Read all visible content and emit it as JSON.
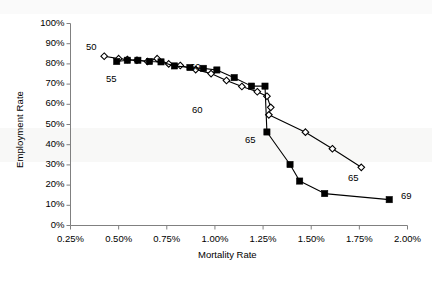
{
  "chart_data": {
    "type": "scatter",
    "title": "",
    "xlabel": "Mortality Rate",
    "ylabel": "Employment Rate",
    "xlim": [
      0.0025,
      0.02
    ],
    "ylim": [
      0,
      1.0
    ],
    "grid": false,
    "legend_position": "bottom-center",
    "x_tick_labels": [
      "0.25%",
      "0.50%",
      "0.75%",
      "1.00%",
      "1.25%",
      "1.50%",
      "1.75%",
      "2.00%"
    ],
    "x_tick_values": [
      0.0025,
      0.005,
      0.0075,
      0.01,
      0.0125,
      0.015,
      0.0175,
      0.02
    ],
    "y_tick_labels": [
      "0%",
      "10%",
      "20%",
      "30%",
      "40%",
      "50%",
      "60%",
      "70%",
      "80%",
      "90%",
      "100%"
    ],
    "y_tick_values": [
      0,
      0.1,
      0.2,
      0.3,
      0.4,
      0.5,
      0.6,
      0.7,
      0.8,
      0.9,
      1.0
    ],
    "series": [
      {
        "name": "1995",
        "marker": "open-diamond",
        "color": "#000000",
        "points": [
          {
            "x": 0.00425,
            "y": 0.838,
            "age": 50,
            "label": "50",
            "label_pos": "above"
          },
          {
            "x": 0.005,
            "y": 0.826,
            "age": 51
          },
          {
            "x": 0.00545,
            "y": 0.822,
            "age": 52
          },
          {
            "x": 0.00595,
            "y": 0.818,
            "age": 53
          },
          {
            "x": 0.0065,
            "y": 0.812,
            "age": 54
          },
          {
            "x": 0.007,
            "y": 0.826,
            "age": 55,
            "label": "55",
            "label_pos": "below"
          },
          {
            "x": 0.0076,
            "y": 0.8,
            "age": 56
          },
          {
            "x": 0.0082,
            "y": 0.792,
            "age": 57
          },
          {
            "x": 0.009,
            "y": 0.772,
            "age": 58
          },
          {
            "x": 0.0098,
            "y": 0.752,
            "age": 59
          },
          {
            "x": 0.0106,
            "y": 0.718,
            "age": 60,
            "label": "60",
            "label_pos": "below"
          },
          {
            "x": 0.0114,
            "y": 0.688,
            "age": 61
          },
          {
            "x": 0.0122,
            "y": 0.662,
            "age": 62
          },
          {
            "x": 0.0127,
            "y": 0.64,
            "age": 63
          },
          {
            "x": 0.0129,
            "y": 0.585,
            "age": 64
          },
          {
            "x": 0.0128,
            "y": 0.548,
            "age": 65
          },
          {
            "x": 0.0147,
            "y": 0.462,
            "age": 66
          },
          {
            "x": 0.0161,
            "y": 0.38,
            "age": 67
          },
          {
            "x": 0.0176,
            "y": 0.288,
            "age": 69,
            "label": "65",
            "label_pos": "below"
          }
        ]
      },
      {
        "name": "2009",
        "marker": "filled-square",
        "color": "#000000",
        "points": [
          {
            "x": 0.0049,
            "y": 0.812,
            "age": 50
          },
          {
            "x": 0.00545,
            "y": 0.818,
            "age": 51
          },
          {
            "x": 0.006,
            "y": 0.818,
            "age": 52
          },
          {
            "x": 0.0066,
            "y": 0.812,
            "age": 53
          },
          {
            "x": 0.0072,
            "y": 0.81,
            "age": 54
          },
          {
            "x": 0.0079,
            "y": 0.79,
            "age": 55
          },
          {
            "x": 0.0087,
            "y": 0.782,
            "age": 56
          },
          {
            "x": 0.0094,
            "y": 0.778,
            "age": 57
          },
          {
            "x": 0.0101,
            "y": 0.77,
            "age": 58
          },
          {
            "x": 0.011,
            "y": 0.732,
            "age": 59
          },
          {
            "x": 0.0119,
            "y": 0.69,
            "age": 60,
            "label": "60",
            "label_pos": "above-right"
          },
          {
            "x": 0.0126,
            "y": 0.69,
            "age": 61
          },
          {
            "x": 0.0127,
            "y": 0.463,
            "age": 62,
            "label": "65",
            "label_pos": "below-left"
          },
          {
            "x": 0.0139,
            "y": 0.302,
            "age": 63
          },
          {
            "x": 0.0144,
            "y": 0.22,
            "age": 64
          },
          {
            "x": 0.0157,
            "y": 0.158,
            "age": 65
          },
          {
            "x": 0.01905,
            "y": 0.128,
            "age": 69,
            "label": "69",
            "label_pos": "right"
          }
        ]
      }
    ],
    "annotations": [
      {
        "text": "50",
        "series": "1995",
        "x_px": 86,
        "y_px": 41
      },
      {
        "text": "55",
        "series": "1995",
        "x_px": 106,
        "y_px": 73
      },
      {
        "text": "60",
        "series": "2009",
        "x_px": 190,
        "y_px": 61
      },
      {
        "text": "60",
        "series": "1995",
        "x_px": 192,
        "y_px": 104
      },
      {
        "text": "65",
        "series": "2009",
        "x_px": 245,
        "y_px": 134
      },
      {
        "text": "65",
        "series": "1995",
        "x_px": 348,
        "y_px": 172
      },
      {
        "text": "69",
        "series": "2009",
        "x_px": 401,
        "y_px": 190
      }
    ],
    "legend": [
      {
        "label": "1995",
        "marker": "open-diamond"
      },
      {
        "label": "2009",
        "marker": "filled-square"
      }
    ]
  },
  "axis": {
    "y_title": "Employment Rate",
    "x_title": "Mortality Rate"
  },
  "colors": {
    "line": "#000000",
    "axis": "#808080",
    "background": "#ffffff",
    "marker_fill_open": "#ffffff"
  }
}
